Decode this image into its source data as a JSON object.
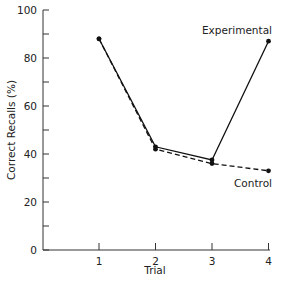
{
  "chart_data": {
    "type": "line",
    "title": "",
    "xlabel": "Trial",
    "ylabel": "Correct Recalls (%)",
    "x": [
      1,
      2,
      3,
      4
    ],
    "categories": [
      "1",
      "2",
      "3",
      "4"
    ],
    "xticks": [
      "1",
      "2",
      "3",
      "4"
    ],
    "yticks": [
      "0",
      "20",
      "40",
      "60",
      "80",
      "100"
    ],
    "yminor_step": 10,
    "ylim": [
      0,
      100
    ],
    "grid": false,
    "legend_position": "inline labels at line ends",
    "series": [
      {
        "name": "Experimental",
        "values": [
          88,
          43,
          37.5,
          87
        ],
        "style": "solid",
        "color": "#111111"
      },
      {
        "name": "Control",
        "values": [
          88,
          42,
          36,
          33
        ],
        "style": "dashed",
        "color": "#111111"
      }
    ]
  },
  "labels": {
    "experimental": "Experimental",
    "control": "Control"
  }
}
